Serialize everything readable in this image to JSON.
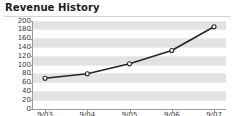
{
  "widget": {
    "title": "Revenue History",
    "width": 234,
    "height": 116,
    "background": "#ffffff",
    "title_color": "#1b1b1b",
    "rule_color": "#d2d2d2"
  },
  "chart_data": {
    "type": "line",
    "title": "Revenue History",
    "xlabel": "",
    "ylabel": "",
    "categories": [
      "9/03",
      "9/04",
      "9/05",
      "9/06",
      "9/07"
    ],
    "values": [
      70,
      80,
      103,
      133,
      187
    ],
    "series": [
      {
        "name": "Revenue",
        "values": [
          70,
          80,
          103,
          133,
          187
        ]
      }
    ],
    "ylim": [
      0,
      200
    ],
    "ytick_values": [
      200,
      180,
      160,
      140,
      120,
      100,
      80,
      60,
      40,
      20,
      0
    ],
    "ytick_labels": [
      "200",
      "180",
      "160",
      "140",
      "120",
      "100",
      "80",
      "60",
      "40",
      "20",
      "0"
    ],
    "ytick_step": 20,
    "xtick_labels": [
      "9/03",
      "9/04",
      "9/05",
      "9/06",
      "9/07"
    ],
    "grid": true,
    "grid_style": "alternating-horizontal-bands",
    "band_color": "#e3e3e3",
    "plot_background": "#ffffff",
    "legend": false,
    "legend_position": "none",
    "line_color": "#262626",
    "line_width": 1.6,
    "marker": "circle",
    "marker_face_color": "#ffffff",
    "marker_edge_color": "#262626",
    "marker_size": 4,
    "axis_color": "#9a9a9a",
    "tick_label_color": "#3a3a3a"
  }
}
